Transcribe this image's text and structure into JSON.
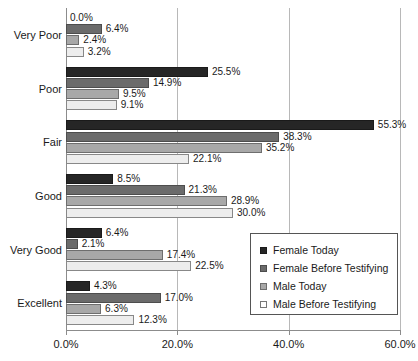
{
  "chart_data": {
    "type": "bar",
    "orientation": "horizontal",
    "title": "",
    "xlabel": "",
    "ylabel": "",
    "xlim": [
      0,
      60
    ],
    "xtick_labels": [
      "0.0%",
      "20.0%",
      "40.0%",
      "60.0%"
    ],
    "xticks": [
      0,
      20,
      40,
      60
    ],
    "grid": true,
    "legend_position": "lower-right",
    "categories": [
      "Very Poor",
      "Poor",
      "Fair",
      "Good",
      "Very Good",
      "Excellent"
    ],
    "series": [
      {
        "name": "Female Today",
        "color": "#262626",
        "values": [
          0.0,
          25.5,
          55.3,
          8.5,
          6.4,
          4.3
        ],
        "labels": [
          "0.0%",
          "25.5%",
          "55.3%",
          "8.5%",
          "6.4%",
          "4.3%"
        ]
      },
      {
        "name": "Female Before Testifying",
        "color": "#6b6b6b",
        "values": [
          6.4,
          14.9,
          38.3,
          21.3,
          2.1,
          17.0
        ],
        "labels": [
          "6.4%",
          "14.9%",
          "38.3%",
          "21.3%",
          "2.1%",
          "17.0%"
        ]
      },
      {
        "name": "Male Today",
        "color": "#a8a8a8",
        "values": [
          2.4,
          9.5,
          35.2,
          28.9,
          17.4,
          6.3
        ],
        "labels": [
          "2.4%",
          "9.5%",
          "35.2%",
          "28.9%",
          "17.4%",
          "6.3%"
        ]
      },
      {
        "name": "Male Before Testifying",
        "color": "#ededed",
        "values": [
          3.2,
          9.1,
          22.1,
          30.0,
          22.5,
          12.3
        ],
        "labels": [
          "3.2%",
          "9.1%",
          "22.1%",
          "30.0%",
          "22.5%",
          "12.3%"
        ]
      }
    ]
  }
}
